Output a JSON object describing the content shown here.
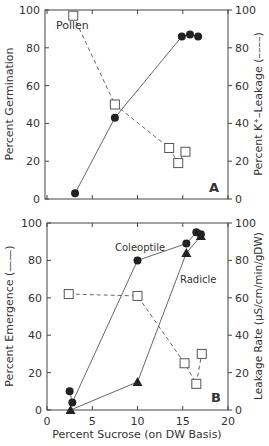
{
  "chart_data": [
    {
      "panel": "A",
      "type": "line",
      "annotation": "Pollen",
      "panel_label": "A",
      "xlabel": "",
      "xlim": [
        0,
        20
      ],
      "x_ticks": [
        0,
        5,
        10,
        15,
        20
      ],
      "ylabel_left": "Percent Germination",
      "ylabel_right": "Percent K+-Leakage (----)",
      "ylim_left": [
        0,
        100
      ],
      "ylim_right": [
        0,
        100
      ],
      "y_ticks": [
        0,
        20,
        40,
        60,
        80,
        100
      ],
      "series": [
        {
          "name": "Germination",
          "axis": "left",
          "marker": "filled-circle",
          "line": "solid",
          "x": [
            3.1,
            7.5,
            14.9,
            15.8,
            16.7
          ],
          "values": [
            3,
            43,
            86,
            87,
            86
          ]
        },
        {
          "name": "K+ Leakage",
          "axis": "right",
          "marker": "open-square",
          "line": "dashed",
          "x": [
            2.9,
            7.5,
            13.5,
            14.5,
            15.3
          ],
          "values": [
            97,
            50,
            27,
            19,
            25
          ]
        }
      ]
    },
    {
      "panel": "B",
      "type": "line",
      "panel_label": "B",
      "xlabel": "Percent Sucrose (on DW Basis)",
      "xlim": [
        0,
        20
      ],
      "x_ticks": [
        0,
        5,
        10,
        15,
        20
      ],
      "ylabel_left": "Percent Emergence (——)",
      "ylabel_right": "Leakage Rate (µS/cm/min/gDW)",
      "ylim_left": [
        0,
        100
      ],
      "ylim_right": [
        0,
        100
      ],
      "y_ticks": [
        0,
        20,
        40,
        60,
        80,
        100
      ],
      "series": [
        {
          "name": "Coleoptile",
          "axis": "left",
          "marker": "filled-circle",
          "line": "solid",
          "x": [
            2.5,
            2.8,
            10,
            15.4,
            16.5,
            17.0
          ],
          "values": [
            10,
            4,
            80,
            89,
            95,
            94
          ]
        },
        {
          "name": "Radicle",
          "axis": "left",
          "marker": "filled-triangle",
          "line": "solid",
          "x": [
            2.6,
            10,
            15.4,
            17.0
          ],
          "values": [
            0,
            15,
            84,
            93
          ]
        },
        {
          "name": "Leakage Rate",
          "axis": "right",
          "marker": "open-square",
          "line": "dashed",
          "x": [
            2.4,
            10,
            15.2,
            16.5,
            17.1
          ],
          "values": [
            62,
            61,
            25,
            14,
            30
          ]
        }
      ]
    }
  ],
  "labels": {
    "a_annotation": "Pollen",
    "a_panel": "A",
    "a_ylabel_left": "Percent Germination",
    "a_ylabel_right": "Percent K⁺–Leakage (––––)",
    "b_panel": "B",
    "b_coleoptile": "Coleoptile",
    "b_radicle": "Radicle",
    "b_ylabel_left": "Percent Emergence (——)",
    "b_ylabel_right": "Leakage Rate (µS/cm/min/gDW)",
    "b_xlabel": "Percent Sucrose (on DW Basis)"
  },
  "colors": {
    "ink": "#222222",
    "text": "#333333",
    "background": "#ffffff"
  }
}
